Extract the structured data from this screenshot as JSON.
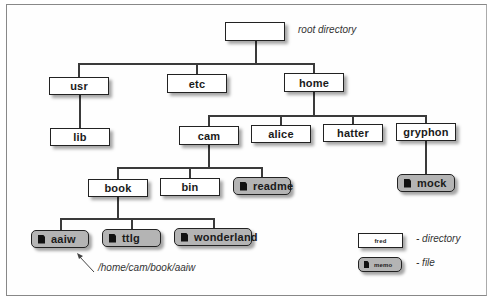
{
  "diagram": {
    "root": {
      "label": "",
      "annotation": "root directory"
    },
    "level1": [
      {
        "label": "usr",
        "type": "directory"
      },
      {
        "label": "etc",
        "type": "directory"
      },
      {
        "label": "home",
        "type": "directory"
      }
    ],
    "usr_children": [
      {
        "label": "lib",
        "type": "directory"
      }
    ],
    "home_children": [
      {
        "label": "cam",
        "type": "directory"
      },
      {
        "label": "alice",
        "type": "directory"
      },
      {
        "label": "hatter",
        "type": "directory"
      },
      {
        "label": "gryphon",
        "type": "directory"
      }
    ],
    "cam_children": [
      {
        "label": "book",
        "type": "directory"
      },
      {
        "label": "bin",
        "type": "directory"
      },
      {
        "label": "readme",
        "type": "file"
      }
    ],
    "gryphon_children": [
      {
        "label": "mock",
        "type": "file"
      }
    ],
    "book_children": [
      {
        "label": "aaiw",
        "type": "file"
      },
      {
        "label": "ttlg",
        "type": "file"
      },
      {
        "label": "wonderland",
        "type": "file"
      }
    ],
    "path_annotation": "/home/cam/book/aaiw",
    "legend": {
      "directory": {
        "sample": "fred",
        "description": "- directory"
      },
      "file": {
        "sample": "memo",
        "description": "- file"
      }
    }
  },
  "colors": {
    "directory_fill": "#ffffff",
    "file_fill": "#b4b4b4",
    "line": "#3a3a3a"
  }
}
